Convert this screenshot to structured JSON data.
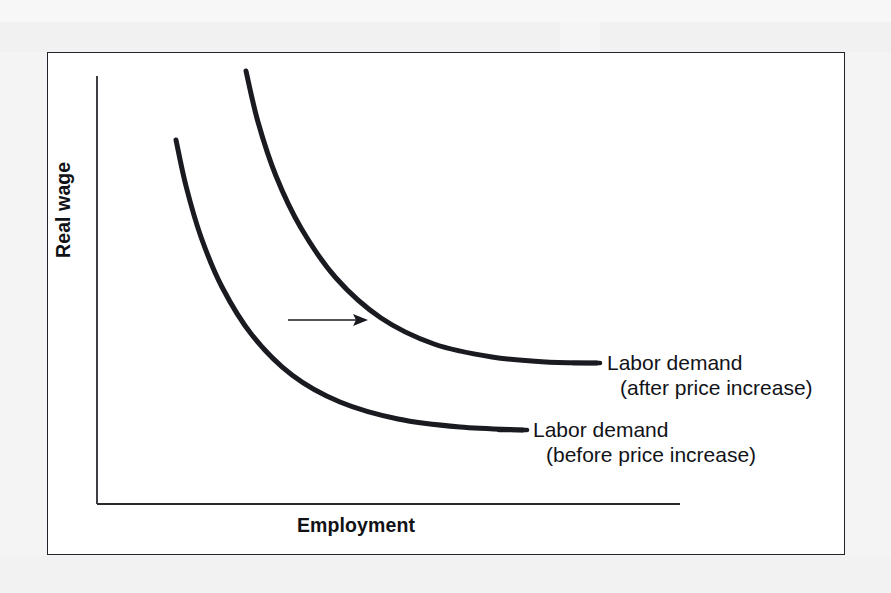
{
  "figure": {
    "kind": "economics-diagram",
    "background_color": "#f4f4f4",
    "panel_color": "#ffffff",
    "frame_color": "#22232a",
    "ink_color": "#121318"
  },
  "axes": {
    "y_title": "Real wage",
    "x_title": "Employment"
  },
  "annotations": {
    "shift_arrow": {
      "name": "rightward-shift-arrow",
      "direction": "right"
    }
  },
  "labels": {
    "after": {
      "line1": "Labor demand",
      "line2": "(after price increase)"
    },
    "before": {
      "line1": "Labor demand",
      "line2": "(before price increase)"
    }
  },
  "chart_data": {
    "type": "line",
    "title": "",
    "xlabel": "Employment",
    "ylabel": "Real wage",
    "grid": false,
    "legend": "inline-callouts",
    "axis_ticks": false,
    "xlim": [
      0,
      100
    ],
    "ylim": [
      0,
      100
    ],
    "series": [
      {
        "name": "Labor demand (before price increase)",
        "label_line1": "Labor demand",
        "label_line2": "(before price increase)",
        "color": "#1a1b20",
        "linewidth": 5,
        "shape": "downward-sloping convex (hyperbolic)",
        "points_px": [
          [
            176,
            140
          ],
          [
            186,
            186
          ],
          [
            201,
            237
          ],
          [
            222,
            287
          ],
          [
            252,
            335
          ],
          [
            292,
            375
          ],
          [
            340,
            402
          ],
          [
            398,
            419
          ],
          [
            460,
            427
          ],
          [
            523,
            430
          ]
        ]
      },
      {
        "name": "Labor demand (after price increase)",
        "label_line1": "Labor demand",
        "label_line2": "(after price increase)",
        "color": "#1a1b20",
        "linewidth": 5,
        "shape": "downward-sloping convex (hyperbolic), shifted right",
        "points_px": [
          [
            246,
            71
          ],
          [
            258,
            122
          ],
          [
            276,
            176
          ],
          [
            301,
            228
          ],
          [
            336,
            278
          ],
          [
            381,
            318
          ],
          [
            434,
            344
          ],
          [
            492,
            357
          ],
          [
            546,
            362
          ],
          [
            597,
            363
          ]
        ]
      }
    ],
    "arrow_px": {
      "x1": 288,
      "y1": 320,
      "x2": 368,
      "y2": 320
    }
  }
}
